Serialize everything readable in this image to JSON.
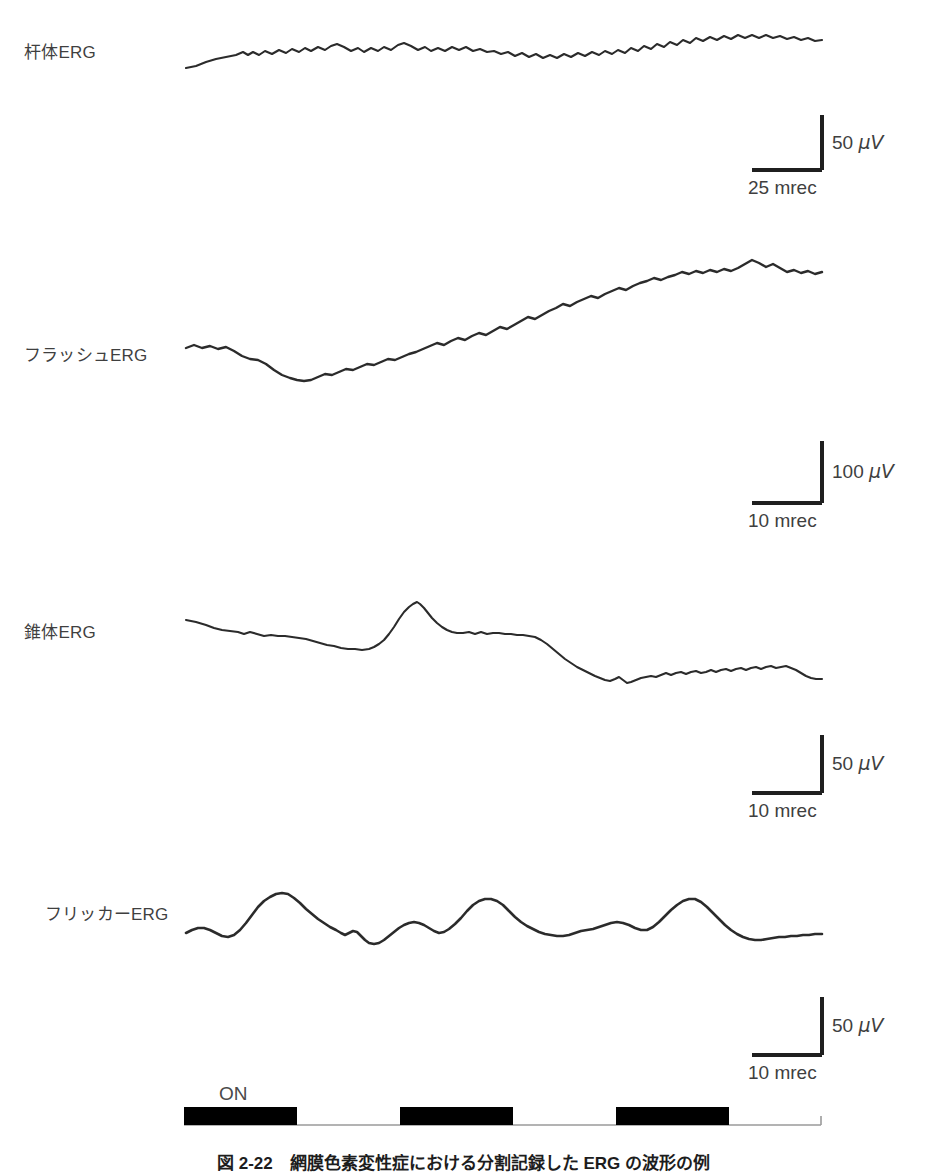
{
  "figure": {
    "caption": "図 2-22　網膜色素変性症における分割記録した ERG の波形の例",
    "background_color": "#ffffff",
    "trace_color": "#2b2b2b",
    "text_color": "#3f3f3f"
  },
  "panels": [
    {
      "id": "rod-erg",
      "label": "杆体ERG",
      "label_x": 24,
      "label_y": 44,
      "scale": {
        "vertical_value": "50 ",
        "vertical_unit": "μV",
        "horizontal_value": "25 mrec",
        "corner_x": 822,
        "corner_y": 170,
        "v_len": 55,
        "h_len": 70
      }
    },
    {
      "id": "flash-erg",
      "label": "フラッシュERG",
      "label_x": 24,
      "label_y": 347,
      "scale": {
        "vertical_value": "100 ",
        "vertical_unit": "μV",
        "horizontal_value": "10 mrec",
        "corner_x": 822,
        "corner_y": 503,
        "v_len": 62,
        "h_len": 70
      }
    },
    {
      "id": "cone-erg",
      "label": "錐体ERG",
      "label_x": 24,
      "label_y": 624,
      "scale": {
        "vertical_value": "50 ",
        "vertical_unit": "μV",
        "horizontal_value": "10 mrec",
        "corner_x": 822,
        "corner_y": 793,
        "v_len": 58,
        "h_len": 70
      }
    },
    {
      "id": "flicker-erg",
      "label": "フリッカーERG",
      "label_x": 45,
      "label_y": 906,
      "scale": {
        "vertical_value": "50 ",
        "vertical_unit": "μV",
        "horizontal_value": "10 mrec",
        "corner_x": 822,
        "corner_y": 1055,
        "v_len": 58,
        "h_len": 70
      }
    }
  ],
  "stimulus": {
    "on_label": "ON",
    "on_label_x": 219,
    "on_label_y": 1084,
    "baseline_y": 1125,
    "baseline_x0": 184,
    "baseline_x1": 821,
    "bar_height": 18,
    "bars": [
      {
        "x": 184,
        "width": 113
      },
      {
        "x": 400,
        "width": 113
      },
      {
        "x": 616,
        "width": 113
      }
    ]
  },
  "chart_data": {
    "type": "line",
    "title": "図 2-22　網膜色素変性症における分割記録した ERG の波形の例",
    "xlabel": "",
    "ylabel": "",
    "grid": false,
    "legend": "none",
    "series": [
      {
        "name": "杆体ERG",
        "amplitude_scale": "50 μV",
        "time_scale": "25 mrec",
        "baseline_y": 68,
        "points": "186,68 196,66 206,62 216,59 226,57 236,55 243,52 248,55 253,52 259,55 265,51 272,54 279,50 286,53 292,49 299,52 305,48 311,51 318,47 325,50 331,46 337,44 344,47 351,51 358,48 364,52 371,48 378,51 384,47 391,50 398,45 404,43 411,46 418,50 425,47 431,51 438,48 445,51 452,47 459,50 466,47 473,51 480,49 487,52 494,51 501,54 508,52 515,56 522,53 529,57 536,54 543,58 550,55 557,58 564,54 571,57 578,53 585,56 592,52 599,55 605,51 612,54 618,50 625,53 631,48 638,51 644,46 651,49 657,44 664,47 670,42 677,45 683,40 690,43 696,38 703,41 710,37 717,40 724,36 731,39 738,35 745,38 752,35 759,38 766,35 773,38 780,36 787,39 794,37 801,40 808,38 815,41 822,40"
      },
      {
        "name": "フラッシュERG",
        "amplitude_scale": "100 μV",
        "time_scale": "10 mrec",
        "baseline_y": 348,
        "points": "186,348 194,345 202,348 210,346 218,349 226,347 234,351 242,356 250,359 258,360 266,364 274,370 282,375 290,378 297,380 304,381 311,380 318,377 325,374 332,375 339,372 346,369 353,370 360,367 367,364 374,365 381,362 388,359 395,360 402,357 409,354 416,352 423,349 430,346 437,343 444,345 451,341 458,338 465,340 472,336 479,333 486,335 493,331 500,327 507,329 514,325 521,321 528,317 535,319 542,315 549,311 556,308 563,304 570,306 577,302 584,299 591,296 598,298 605,294 612,291 619,288 626,290 633,286 640,283 647,281 654,278 661,280 668,277 675,275 682,272 689,274 696,271 703,273 710,270 717,272 724,269 731,271 738,268 745,264 752,260 759,263 766,267 773,264 780,268 787,272 794,270 801,273 808,271 815,274 822,272"
      },
      {
        "name": "錐体ERG",
        "amplitude_scale": "50 μV",
        "time_scale": "10 mrec",
        "baseline_y": 620,
        "points": "186,620 196,622 206,625 214,628 222,630 230,631 238,632 244,634 250,632 257,634 264,636 271,635 278,636 285,636 292,637 299,638 306,639 313,641 320,643 327,645 334,646 341,648 348,649 355,649 362,650 369,649 374,647 379,644 384,640 389,634 394,627 399,619 404,612 409,607 413,604 417,602 420,604 424,608 428,613 432,618 437,623 442,627 447,630 452,632 457,633 463,633 469,632 475,634 481,632 487,634 493,633 499,633 505,634 511,634 517,635 523,635 529,636 535,637 541,640 547,644 553,649 559,654 565,659 571,663 577,667 583,670 589,673 595,676 600,678 605,680 610,681 615,679 619,677 623,680 627,683 631,682 636,680 641,678 646,677 651,676 656,677 661,675 666,673 671,675 676,673 681,672 686,674 691,672 696,671 701,673 706,672 711,670 716,672 721,670 726,669 731,671 736,669 741,668 746,670 751,668 756,667 761,669 766,667 771,666 776,668 781,667 786,666 791,668 796,670 801,673 806,676 811,678 816,679 822,679"
      },
      {
        "name": "フリッカーERG",
        "amplitude_scale": "50 μV",
        "time_scale": "10 mrec",
        "baseline_y": 935,
        "points": "186,933 192,930 198,928 204,928 210,930 216,933 222,936 228,937 234,935 240,930 246,923 252,915 258,907 264,901 270,897 276,894 282,893 288,894 294,898 300,903 306,909 312,914 318,919 324,923 330,927 336,930 341,933 345,935 349,933 353,931 357,932 361,936 365,940 369,943 374,944 379,943 384,940 389,936 394,932 399,928 404,925 409,923 414,922 419,923 424,925 429,928 434,931 439,933 444,932 449,929 455,924 461,918 467,911 473,905 479,901 485,899 491,899 497,901 503,905 509,911 515,917 521,922 527,926 533,929 539,932 545,934 551,935 557,936 563,936 569,935 575,933 581,931 587,930 593,929 599,927 605,925 611,923 617,922 623,923 629,925 635,928 641,930 647,930 653,927 659,922 665,916 671,910 677,905 683,901 689,899 695,899 701,902 707,907 713,913 719,919 725,925 731,930 737,934 743,937 749,939 755,940 761,940 767,939 773,938 779,937 785,937 791,936 797,936 803,935 809,935 815,934 822,934"
      }
    ]
  }
}
